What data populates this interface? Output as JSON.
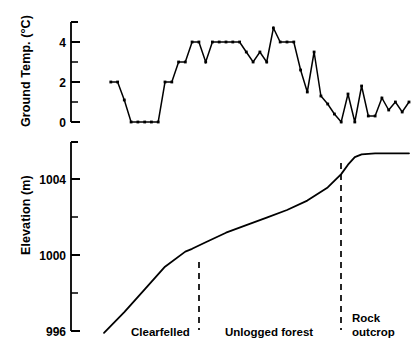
{
  "figure": {
    "background_color": "#ffffff",
    "ink_color": "#000000",
    "width": 416,
    "height": 350
  },
  "top_panel": {
    "ylabel": "Ground Temp. (°C)",
    "tick_labels": [
      "4",
      "2",
      "0"
    ]
  },
  "bottom_panel": {
    "ylabel": "Elevation (m)",
    "tick_labels": [
      "1004",
      "1000",
      "996"
    ]
  },
  "zones": [
    {
      "label": "Clearfelled"
    },
    {
      "label": "Unlogged forest"
    },
    {
      "label": "Rock outcrop"
    }
  ],
  "chart_data": [
    {
      "type": "line",
      "title": "Ground temperature transect",
      "xlabel": "",
      "ylabel": "Ground Temp. (°C)",
      "ylim": [
        0,
        5
      ],
      "yticks": [
        0,
        1,
        2,
        3,
        4,
        5
      ],
      "ytick_labels": [
        "0",
        "",
        "2",
        "",
        "4",
        ""
      ],
      "grid": false,
      "legend": "none",
      "markers": true,
      "xlim": [
        0,
        45
      ],
      "x": [
        1,
        2,
        3,
        4,
        5,
        6,
        7,
        8,
        9,
        10,
        11,
        12,
        13,
        14,
        15,
        16,
        17,
        18,
        19,
        20,
        21,
        22,
        23,
        24,
        25,
        26,
        27,
        28,
        29,
        30,
        31,
        32,
        33,
        34,
        35,
        36,
        37,
        38,
        39,
        40,
        41,
        42,
        43,
        44,
        45
      ],
      "values": [
        2.0,
        2.0,
        1.1,
        0.0,
        0.0,
        0.0,
        0.0,
        0.0,
        2.0,
        2.0,
        3.0,
        3.0,
        4.0,
        4.0,
        3.0,
        4.0,
        4.0,
        4.0,
        4.0,
        4.0,
        3.5,
        3.0,
        3.5,
        3.0,
        4.7,
        4.0,
        4.0,
        4.0,
        2.6,
        1.5,
        3.5,
        1.3,
        0.9,
        0.4,
        0.0,
        1.4,
        0.0,
        1.8,
        0.3,
        0.3,
        1.2,
        0.6,
        1.0,
        0.5,
        1.0
      ]
    },
    {
      "type": "line",
      "title": "Elevation profile",
      "xlabel": "",
      "ylabel": "Elevation (m)",
      "ylim": [
        996,
        1006
      ],
      "yticks": [
        996,
        998,
        1000,
        1002,
        1004,
        1006
      ],
      "ytick_labels": [
        "996",
        "",
        "1000",
        "",
        "1004",
        ""
      ],
      "grid": false,
      "legend": "none",
      "markers": false,
      "xlim": [
        0,
        45
      ],
      "x": [
        0,
        3,
        6,
        9,
        12,
        13,
        15,
        18,
        21,
        24,
        27,
        30,
        33,
        35,
        36,
        37,
        38,
        40,
        45
      ],
      "values": [
        995.9,
        997.0,
        998.2,
        999.4,
        1000.2,
        1000.35,
        1000.7,
        1001.2,
        1001.6,
        1002.0,
        1002.4,
        1002.9,
        1003.6,
        1004.3,
        1004.8,
        1005.2,
        1005.35,
        1005.4,
        1005.4
      ],
      "annotations": [
        {
          "label": "Clearfelled",
          "x": 13
        },
        {
          "label": "Unlogged forest",
          "x": 35
        },
        {
          "label": "Rock outcrop",
          "x": 45
        }
      ]
    }
  ]
}
